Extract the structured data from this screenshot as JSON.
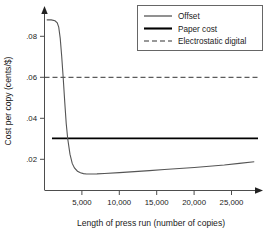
{
  "chart_data": {
    "type": "line",
    "title": "",
    "xlabel": "Length of press run (number of copies)",
    "ylabel": "Cost per copy (cents/$)",
    "xlim": [
      0,
      28500
    ],
    "ylim": [
      0,
      0.094
    ],
    "grid": false,
    "legend_position": "top-right",
    "xticks": [
      5000,
      10000,
      15000,
      20000,
      25000
    ],
    "xtick_labels": [
      "5,000",
      "10,000",
      "15,000",
      "20,000",
      "25,000"
    ],
    "yticks": [
      0.02,
      0.04,
      0.06,
      0.08
    ],
    "ytick_labels": [
      ".02",
      ".04",
      ".06",
      ".08"
    ],
    "series": [
      {
        "name": "Offset",
        "style": "solid-thin",
        "color": "#555555",
        "x": [
          300,
          900,
          1400,
          1700,
          1900,
          2100,
          2300,
          2500,
          2700,
          2900,
          3100,
          3400,
          3700,
          4000,
          4400,
          4800,
          5200,
          5600,
          6000,
          7000,
          8000,
          10000,
          12000,
          14000,
          16000,
          18000,
          20000,
          22000,
          24000,
          26000,
          28000
        ],
        "y": [
          0.088,
          0.088,
          0.0876,
          0.0866,
          0.0845,
          0.079,
          0.07,
          0.0595,
          0.048,
          0.0375,
          0.03,
          0.0225,
          0.018,
          0.0158,
          0.0142,
          0.0134,
          0.013,
          0.0128,
          0.0128,
          0.0129,
          0.0131,
          0.0135,
          0.014,
          0.0145,
          0.015,
          0.0155,
          0.016,
          0.0166,
          0.0172,
          0.018,
          0.0188
        ]
      },
      {
        "name": "Paper cost",
        "style": "solid-thick",
        "color": "#000000",
        "x": [
          1000,
          28500
        ],
        "y": [
          0.0302,
          0.0302
        ]
      },
      {
        "name": "Electrostatic digital",
        "style": "dashed",
        "color": "#333333",
        "x": [
          0,
          28500
        ],
        "y": [
          0.06,
          0.06
        ]
      }
    ],
    "legend_entries": [
      {
        "label": "Offset",
        "style": "solid-thin"
      },
      {
        "label": "Paper cost",
        "style": "solid-thick"
      },
      {
        "label": "Electrostatic digital",
        "style": "dashed"
      }
    ],
    "annotations": []
  }
}
